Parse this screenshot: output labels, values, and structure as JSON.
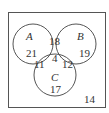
{
  "diagram": {
    "type": "venn-3",
    "sets": [
      {
        "name": "A",
        "only": "21"
      },
      {
        "name": "B",
        "only": "19"
      },
      {
        "name": "C",
        "only": "17"
      }
    ],
    "regions": {
      "A_only": "21",
      "B_only": "19",
      "C_only": "17",
      "AB_only": "18",
      "AC_only": "11",
      "BC_only": "12",
      "ABC": "4",
      "outside": "14"
    },
    "labels": {
      "A": "A",
      "B": "B",
      "C": "C"
    },
    "stroke_color": "#555555"
  }
}
